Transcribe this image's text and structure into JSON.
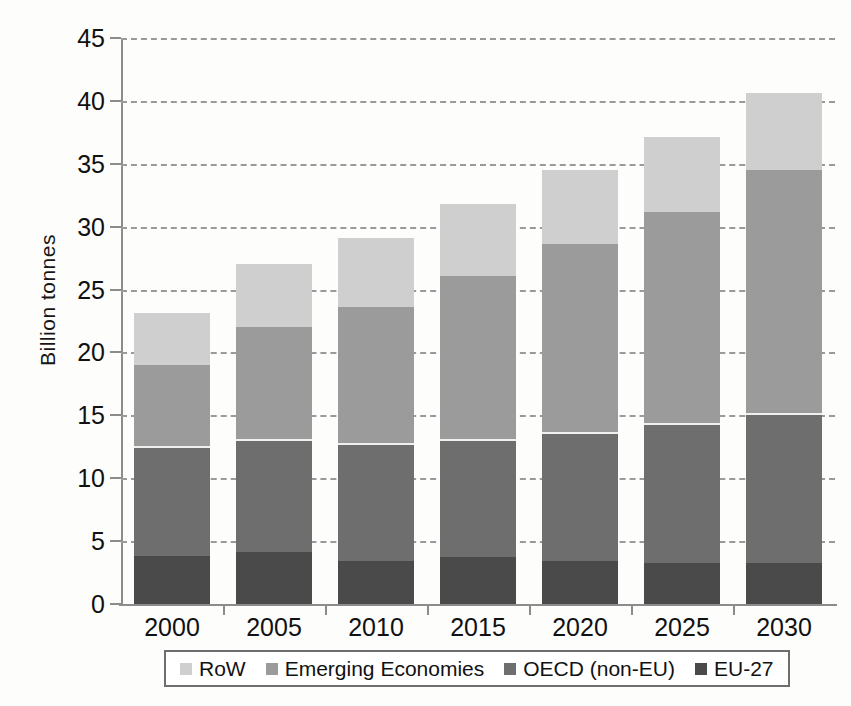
{
  "chart_data": {
    "type": "bar",
    "stacked": true,
    "title": "",
    "xlabel": "",
    "ylabel": "Billion tonnes",
    "categories": [
      "2000",
      "2005",
      "2010",
      "2015",
      "2020",
      "2025",
      "2030"
    ],
    "ylim": [
      0,
      45
    ],
    "yticks": [
      0,
      5,
      10,
      15,
      20,
      25,
      30,
      35,
      40,
      45
    ],
    "ytick_labels": [
      "0",
      "5",
      "10",
      "15",
      "20",
      "25",
      "30",
      "35",
      "40",
      "45"
    ],
    "grid": true,
    "grid_style": "dashed-horizontal",
    "legend_position": "bottom",
    "series": [
      {
        "name": "EU-27",
        "color": "#4a4a4a",
        "values": [
          3.8,
          4.1,
          3.4,
          3.7,
          3.4,
          3.3,
          3.3
        ]
      },
      {
        "name": "OECD (non-EU)",
        "color": "#6e6e6e",
        "values": [
          8.8,
          9.0,
          9.4,
          9.4,
          10.3,
          11.1,
          11.9
        ]
      },
      {
        "name": "Emerging Economies",
        "color": "#9b9b9b",
        "values": [
          6.4,
          8.9,
          10.8,
          13.0,
          14.9,
          16.8,
          19.3
        ]
      },
      {
        "name": "RoW",
        "color": "#cfcfcf",
        "values": [
          4.1,
          5.0,
          5.5,
          5.7,
          5.9,
          5.9,
          6.1
        ]
      }
    ],
    "stack_order_bottom_to_top": [
      "EU-27",
      "OECD (non-EU)",
      "Emerging Economies",
      "RoW"
    ],
    "cumulative_tops": {
      "2000": {
        "EU-27": 3.8,
        "OECD (non-EU)": 12.6,
        "Emerging Economies": 19.0,
        "RoW": 23.1
      },
      "2005": {
        "EU-27": 4.1,
        "OECD (non-EU)": 13.1,
        "Emerging Economies": 22.0,
        "RoW": 27.0
      },
      "2010": {
        "EU-27": 3.4,
        "OECD (non-EU)": 12.8,
        "Emerging Economies": 23.6,
        "RoW": 29.1
      },
      "2015": {
        "EU-27": 3.7,
        "OECD (non-EU)": 13.1,
        "Emerging Economies": 26.1,
        "RoW": 31.8
      },
      "2020": {
        "EU-27": 3.4,
        "OECD (non-EU)": 13.7,
        "Emerging Economies": 28.6,
        "RoW": 34.5
      },
      "2025": {
        "EU-27": 3.3,
        "OECD (non-EU)": 14.4,
        "Emerging Economies": 31.2,
        "RoW": 37.1
      },
      "2030": {
        "EU-27": 3.3,
        "OECD (non-EU)": 15.2,
        "Emerging Economies": 34.5,
        "RoW": 40.6
      }
    },
    "totals": [
      23.1,
      27.0,
      29.1,
      31.8,
      34.5,
      37.1,
      40.6
    ]
  },
  "legend": {
    "items": [
      {
        "label": "RoW",
        "color": "#cfcfcf"
      },
      {
        "label": "Emerging Economies",
        "color": "#9b9b9b"
      },
      {
        "label": "OECD (non-EU)",
        "color": "#6e6e6e"
      },
      {
        "label": "EU-27",
        "color": "#4a4a4a"
      }
    ]
  },
  "axes": {
    "y_title": "Billion tonnes"
  }
}
